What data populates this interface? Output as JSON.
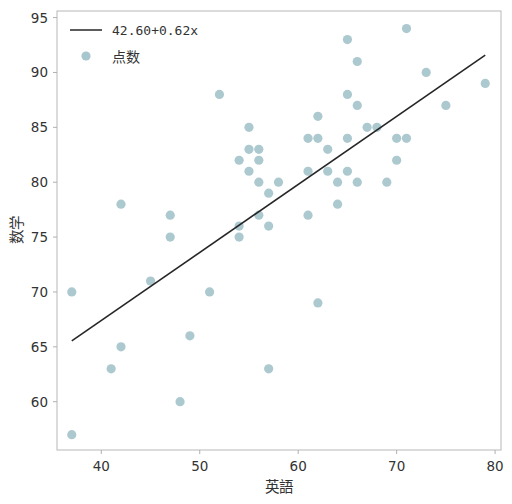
{
  "chart_data": {
    "type": "scatter",
    "title": "",
    "xlabel": "英語",
    "ylabel": "数学",
    "xlim": [
      35.5,
      80.6
    ],
    "ylim": [
      55.6,
      95.6
    ],
    "xticks": [
      40,
      50,
      60,
      70,
      80
    ],
    "yticks": [
      60,
      65,
      70,
      75,
      80,
      85,
      90,
      95
    ],
    "grid": false,
    "legend_position": "upper left",
    "marker_color": "#a8c6ce",
    "line_color": "#262626",
    "axis_color": "#b0b0b0",
    "background": "#ffffff",
    "series": [
      {
        "name": "点数",
        "type": "scatter",
        "marker": "circle",
        "points": [
          [
            37,
            70
          ],
          [
            37,
            57
          ],
          [
            41,
            63
          ],
          [
            42,
            65
          ],
          [
            42,
            78
          ],
          [
            45,
            71
          ],
          [
            47,
            77
          ],
          [
            47,
            75
          ],
          [
            48,
            60
          ],
          [
            49,
            66
          ],
          [
            51,
            70
          ],
          [
            52,
            88
          ],
          [
            54,
            82
          ],
          [
            54,
            76
          ],
          [
            54,
            75
          ],
          [
            55,
            85
          ],
          [
            55,
            81
          ],
          [
            55,
            83
          ],
          [
            56,
            80
          ],
          [
            56,
            83
          ],
          [
            56,
            77
          ],
          [
            56,
            82
          ],
          [
            57,
            79
          ],
          [
            57,
            76
          ],
          [
            57,
            63
          ],
          [
            58,
            80
          ],
          [
            61,
            84
          ],
          [
            61,
            81
          ],
          [
            61,
            77
          ],
          [
            62,
            84
          ],
          [
            62,
            86
          ],
          [
            62,
            69
          ],
          [
            63,
            81
          ],
          [
            63,
            83
          ],
          [
            64,
            80
          ],
          [
            64,
            78
          ],
          [
            65,
            93
          ],
          [
            65,
            88
          ],
          [
            65,
            84
          ],
          [
            65,
            81
          ],
          [
            66,
            91
          ],
          [
            66,
            87
          ],
          [
            66,
            80
          ],
          [
            67,
            85
          ],
          [
            68,
            85
          ],
          [
            69,
            80
          ],
          [
            70,
            84
          ],
          [
            70,
            82
          ],
          [
            71,
            94
          ],
          [
            71,
            84
          ],
          [
            73,
            90
          ],
          [
            75,
            87
          ],
          [
            79,
            89
          ]
        ]
      },
      {
        "name": "42.60+0.62x",
        "type": "line",
        "intercept": 42.6,
        "slope": 0.62,
        "x_range": [
          37,
          79
        ]
      }
    ],
    "legend_entries": [
      {
        "label": "42.60+0.62x",
        "kind": "line",
        "color": "#262626"
      },
      {
        "label": "点数",
        "kind": "marker",
        "color": "#a8c6ce"
      }
    ]
  }
}
